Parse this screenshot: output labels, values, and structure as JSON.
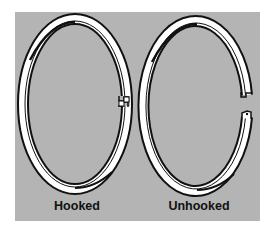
{
  "figure": {
    "background_color": "#b4b4b4",
    "ring_fill": "#ffffff",
    "ring_outline": "#111111",
    "rings": [
      {
        "id": "hooked",
        "label": "Hooked",
        "state": "closed, ends interlocked"
      },
      {
        "id": "unhooked",
        "label": "Unhooked",
        "state": "open, ends separated"
      }
    ]
  }
}
